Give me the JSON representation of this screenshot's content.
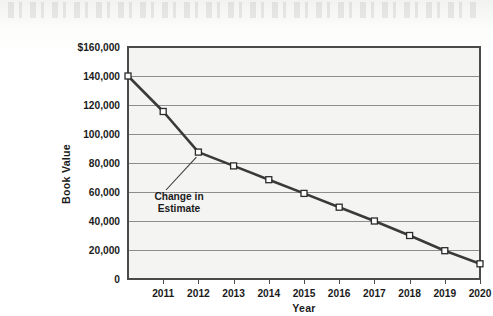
{
  "chart_data": {
    "type": "line",
    "title": "",
    "xlabel": "Year",
    "ylabel": "Book Value",
    "x": [
      2010,
      2011,
      2012,
      2013,
      2014,
      2015,
      2016,
      2017,
      2018,
      2019,
      2020
    ],
    "categories": [
      "",
      "2011",
      "2012",
      "2013",
      "2014",
      "2015",
      "2016",
      "2017",
      "2018",
      "2019",
      "2020"
    ],
    "values": [
      140000,
      115500,
      87500,
      78000,
      68500,
      59000,
      49500,
      40000,
      30000,
      19500,
      10500
    ],
    "series": [
      {
        "name": "Book Value",
        "values": [
          140000,
          115500,
          87500,
          78000,
          68500,
          59000,
          49500,
          40000,
          30000,
          19500,
          10500
        ]
      }
    ],
    "ylim": [
      0,
      160000
    ],
    "xlim": [
      2010,
      2020
    ],
    "ytick_labels": [
      "$160,000",
      "140,000",
      "120,000",
      "100,000",
      "80,000",
      "60,000",
      "40,000",
      "20,000",
      "0"
    ],
    "ytick_values": [
      160000,
      140000,
      120000,
      100000,
      80000,
      60000,
      40000,
      20000,
      0
    ],
    "xtick_labels": [
      "2011",
      "2012",
      "2013",
      "2014",
      "2015",
      "2016",
      "2017",
      "2018",
      "2019",
      "2020"
    ],
    "grid": "horizontal",
    "legend": "none",
    "marker": "open-square",
    "line_color": "#3a3a3a",
    "marker_fill": "#ffffff",
    "marker_stroke": "#2b2b2b",
    "grid_color": "#8d8d8d",
    "frame_color": "#4a4a4a",
    "plot_background": "#f5f5f4",
    "annotations": [
      {
        "name": "change-in-estimate",
        "line1": "Change in",
        "line2": "Estimate",
        "points_to_x": 2012,
        "points_to_y": 87500
      }
    ]
  }
}
